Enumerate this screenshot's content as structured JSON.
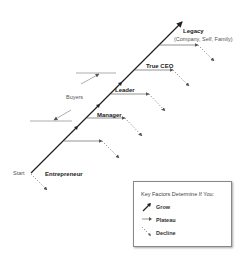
{
  "diagram": {
    "start_label": "Start",
    "stages": [
      {
        "label": "Entrepreneur"
      },
      {
        "label": "Manager"
      },
      {
        "label": "Leader"
      },
      {
        "label": "True CEO"
      },
      {
        "label": "Legacy",
        "sublabel": "(Company, Self, Family)"
      }
    ],
    "buyers_label": "Buyers"
  },
  "legend": {
    "title": "Key Factors Determine If You:",
    "items": [
      {
        "label": "Grow",
        "icon": "grow-arrow-icon"
      },
      {
        "label": "Plateau",
        "icon": "plateau-arrow-icon"
      },
      {
        "label": "Decline",
        "icon": "decline-arrow-icon"
      }
    ]
  },
  "colors": {
    "line": "#222222",
    "branch": "#666666",
    "decline": "#555555"
  }
}
